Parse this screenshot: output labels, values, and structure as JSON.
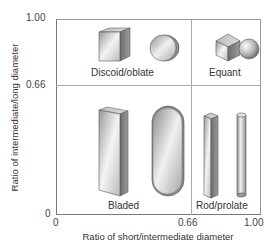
{
  "diagram": {
    "type": "classification-diagram",
    "title": "",
    "x_axis": {
      "label": "Ratio of short/intermediate diameter",
      "ticks": [
        "0",
        "0.66",
        "1.00"
      ]
    },
    "y_axis": {
      "label": "Ratio of intermediate/long diameter",
      "ticks": [
        "0",
        "0.66",
        "1.00"
      ]
    },
    "thresholds": {
      "x": 0.66,
      "y": 0.66
    },
    "quadrants": [
      {
        "label": "Discoid/oblate",
        "position": "top-left",
        "shapes": [
          "flat-square-slab",
          "flat-disc"
        ]
      },
      {
        "label": "Equant",
        "position": "top-right",
        "shapes": [
          "cube",
          "sphere"
        ]
      },
      {
        "label": "Bladed",
        "position": "bottom-left",
        "shapes": [
          "tall-flat-slab",
          "tall-rounded-capsule"
        ]
      },
      {
        "label": "Rod/prolate",
        "position": "bottom-right",
        "shapes": [
          "square-prism-rod",
          "cylinder-rod"
        ]
      }
    ]
  }
}
